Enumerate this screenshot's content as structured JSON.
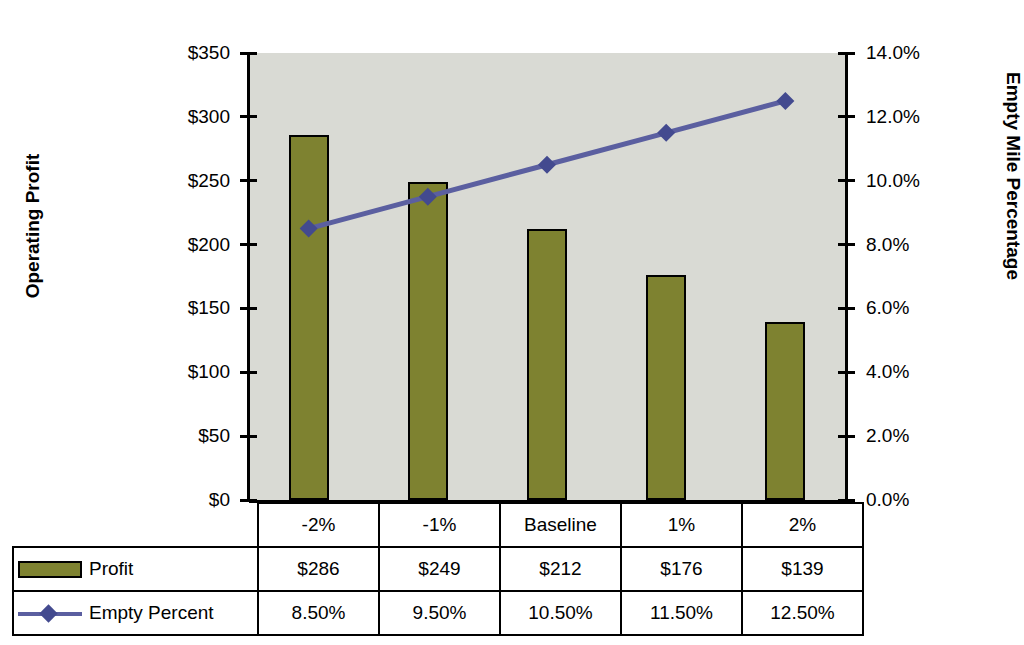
{
  "chart_data": {
    "type": "bar",
    "title": "",
    "categories": [
      "-2%",
      "-1%",
      "Baseline",
      "1%",
      "2%"
    ],
    "series": [
      {
        "name": "Profit",
        "type": "bar",
        "axis": "left",
        "values": [
          286,
          249,
          212,
          176,
          139
        ],
        "labels": [
          "$286",
          "$249",
          "$212",
          "$176",
          "$139"
        ],
        "color": "#7e8230"
      },
      {
        "name": "Empty Percent",
        "type": "line",
        "axis": "right",
        "values": [
          8.5,
          9.5,
          10.5,
          11.5,
          12.5
        ],
        "labels": [
          "8.50%",
          "9.50%",
          "10.50%",
          "11.50%",
          "12.50%"
        ],
        "color": "#5b5fa0"
      }
    ],
    "xlabel": "",
    "ylabel": "Operating Profit",
    "y2label": "Empty Mile Percentage",
    "ylim": [
      0,
      350
    ],
    "y2lim": [
      0,
      14
    ],
    "yticks": [
      0,
      50,
      100,
      150,
      200,
      250,
      300,
      350
    ],
    "ytick_labels": [
      "$0",
      "$50",
      "$100",
      "$150",
      "$200",
      "$250",
      "$300",
      "$350"
    ],
    "y2ticks": [
      0,
      2,
      4,
      6,
      8,
      10,
      12,
      14
    ],
    "y2tick_labels": [
      "0.0%",
      "2.0%",
      "4.0%",
      "6.0%",
      "8.0%",
      "10.0%",
      "12.0%",
      "14.0%"
    ],
    "grid": false,
    "legend_position": "data-table-below",
    "plot_background": "#d9dad4"
  },
  "axes": {
    "left_title": "Operating Profit",
    "right_title": "Empty Mile Percentage",
    "left_ticks": [
      "$350",
      "$300",
      "$250",
      "$200",
      "$150",
      "$100",
      "$50",
      "$0"
    ],
    "right_ticks": [
      "14.0%",
      "12.0%",
      "10.0%",
      "8.0%",
      "6.0%",
      "4.0%",
      "2.0%",
      "0.0%"
    ]
  },
  "table": {
    "categories": [
      "-2%",
      "-1%",
      "Baseline",
      "1%",
      "2%"
    ],
    "rows": [
      {
        "label": "Profit",
        "marker": "bar-swatch",
        "values": [
          "$286",
          "$249",
          "$212",
          "$176",
          "$139"
        ]
      },
      {
        "label": "Empty Percent",
        "marker": "line-swatch",
        "values": [
          "8.50%",
          "9.50%",
          "10.50%",
          "11.50%",
          "12.50%"
        ]
      }
    ]
  }
}
